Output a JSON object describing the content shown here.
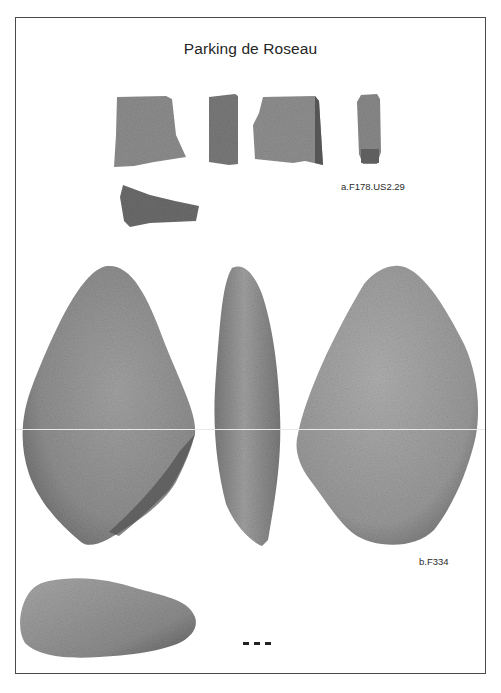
{
  "plate": {
    "title": "Parking de Roseau",
    "border_color": "#4a4a4a",
    "background": "#ffffff"
  },
  "objects": [
    {
      "id": "a",
      "label": "a.F178.US2.29",
      "description": "ceramic sherd fragments",
      "views": [
        "front",
        "profile",
        "back",
        "edge",
        "section"
      ]
    },
    {
      "id": "b",
      "label": "b.F334",
      "description": "stone pebble tool",
      "views": [
        "front",
        "profile",
        "back",
        "top"
      ]
    }
  ],
  "scale_bar": {
    "segments": 3,
    "color": "#222222"
  }
}
